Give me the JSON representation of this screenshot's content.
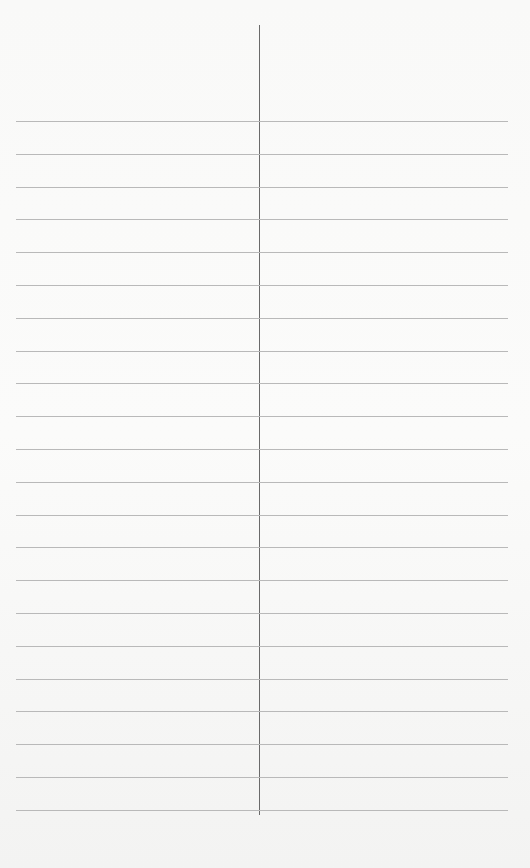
{
  "page": {
    "type": "ruled-paper",
    "ruled_lines": 22,
    "first_line_y": 121,
    "line_spacing": 32.8,
    "divider": {
      "x": 259,
      "top": 25,
      "bottom": 815
    },
    "colors": {
      "paper": "#f9f9f8",
      "rule": "#b9b9b9",
      "divider": "#6a6a6a"
    }
  }
}
